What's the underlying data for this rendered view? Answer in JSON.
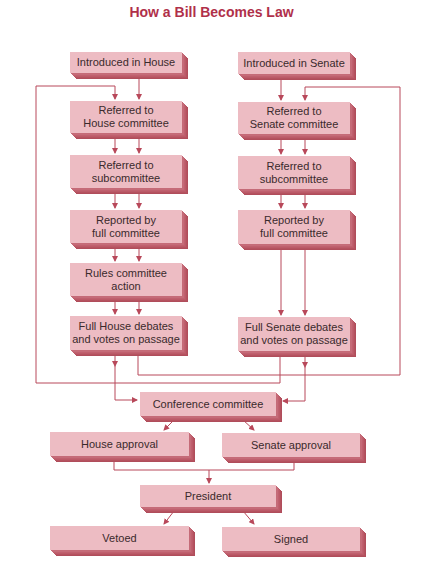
{
  "title": "How a Bill Becomes Law",
  "colors": {
    "title": "#b0304a",
    "box_face": "#edbcc3",
    "box_side": "#b04d5b",
    "connector": "#b8485a"
  },
  "house_column": [
    {
      "id": "house-introduced",
      "label": "Introduced in House"
    },
    {
      "id": "house-committee",
      "label": "Referred to\nHouse committee"
    },
    {
      "id": "house-subcommittee",
      "label": "Referred to\nsubcommittee"
    },
    {
      "id": "house-reported",
      "label": "Reported by\nfull committee"
    },
    {
      "id": "house-rules",
      "label": "Rules committee\naction"
    },
    {
      "id": "house-floor",
      "label": "Full House debates\nand votes on passage"
    }
  ],
  "senate_column": [
    {
      "id": "senate-introduced",
      "label": "Introduced in Senate"
    },
    {
      "id": "senate-committee",
      "label": "Referred to\nSenate committee"
    },
    {
      "id": "senate-subcommittee",
      "label": "Referred to\nsubcommittee"
    },
    {
      "id": "senate-reported",
      "label": "Reported by\nfull committee"
    },
    {
      "id": "senate-floor",
      "label": "Full Senate debates\nand votes on passage"
    }
  ],
  "shared": {
    "conference": "Conference committee",
    "house_approval": "House approval",
    "senate_approval": "Senate approval",
    "president": "President",
    "vetoed": "Vetoed",
    "signed": "Signed"
  },
  "edges": [
    [
      "Introduced in House",
      "Referred to House committee"
    ],
    [
      "Referred to House committee",
      "Referred to subcommittee (House)"
    ],
    [
      "Referred to subcommittee (House)",
      "Reported by full committee (House)"
    ],
    [
      "Reported by full committee (House)",
      "Rules committee action"
    ],
    [
      "Rules committee action",
      "Full House debates and votes on passage"
    ],
    [
      "Full House debates and votes on passage",
      "Conference committee"
    ],
    [
      "Full House debates and votes on passage",
      "Referred to Senate committee"
    ],
    [
      "Introduced in Senate",
      "Referred to Senate committee"
    ],
    [
      "Referred to Senate committee",
      "Referred to subcommittee (Senate)"
    ],
    [
      "Referred to subcommittee (Senate)",
      "Reported by full committee (Senate)"
    ],
    [
      "Reported by full committee (Senate)",
      "Full Senate debates and votes on passage"
    ],
    [
      "Full Senate debates and votes on passage",
      "Conference committee"
    ],
    [
      "Full Senate debates and votes on passage",
      "Referred to House committee"
    ],
    [
      "Conference committee",
      "House approval"
    ],
    [
      "Conference committee",
      "Senate approval"
    ],
    [
      "House approval",
      "President"
    ],
    [
      "Senate approval",
      "President"
    ],
    [
      "President",
      "Vetoed"
    ],
    [
      "President",
      "Signed"
    ]
  ]
}
